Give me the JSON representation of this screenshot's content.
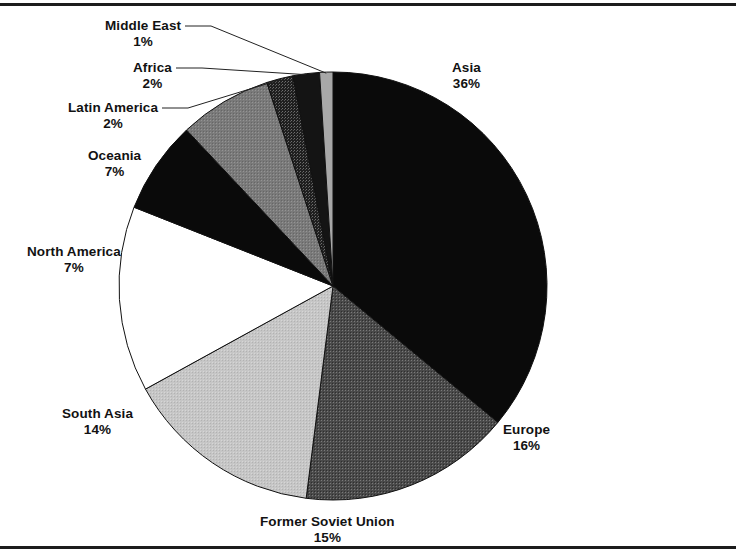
{
  "figure": {
    "name": "world-population-pie-chart",
    "background_color": "#ffffff",
    "border_color": "#1c1c1c",
    "text_color": "#121212"
  },
  "chart_data": {
    "type": "pie",
    "title": "",
    "subtitle": "",
    "xlabel": "",
    "ylabel": "",
    "legend_position": "none",
    "grid": false,
    "units": "percent",
    "start_angle_deg": 0,
    "direction": "clockwise",
    "total": 100,
    "categories": [
      "Asia",
      "Europe",
      "Former Soviet Union",
      "South Asia",
      "North America",
      "Oceania",
      "Latin America",
      "Africa",
      "Middle East"
    ],
    "values": [
      36,
      16,
      15,
      14,
      7,
      7,
      2,
      2,
      1
    ],
    "slices": [
      {
        "label": "Asia",
        "value": 36,
        "percent_text": "36%",
        "fill": "#0a0a0a",
        "pattern": "solid-black",
        "label_x": 452,
        "label_y": 60,
        "leader": false
      },
      {
        "label": "Europe",
        "value": 16,
        "percent_text": "16%",
        "fill": "#535353",
        "pattern": "halftone-dark-gray",
        "label_x": 503,
        "label_y": 422,
        "leader": false
      },
      {
        "label": "Former Soviet Union",
        "value": 15,
        "percent_text": "15%",
        "fill": "#c2c2c2",
        "pattern": "halftone-light-gray",
        "label_x": 260,
        "label_y": 514,
        "leader": false
      },
      {
        "label": "South Asia",
        "value": 14,
        "percent_text": "14%",
        "fill": "#ffffff",
        "pattern": "solid-white",
        "label_x": 62,
        "label_y": 406,
        "leader": false
      },
      {
        "label": "North America",
        "value": 7,
        "percent_text": "7%",
        "fill": "#0a0a0a",
        "pattern": "solid-black",
        "label_x": 27,
        "label_y": 244,
        "leader": false
      },
      {
        "label": "Oceania",
        "value": 7,
        "percent_text": "7%",
        "fill": "#7d7d7d",
        "pattern": "halftone-medium-gray",
        "label_x": 88,
        "label_y": 148,
        "leader": false
      },
      {
        "label": "Latin America",
        "value": 2,
        "percent_text": "2%",
        "fill": "#3a3a3a",
        "pattern": "halftone-dotted-dark",
        "label_x": 68,
        "label_y": 100,
        "leader": true
      },
      {
        "label": "Africa",
        "value": 2,
        "percent_text": "2%",
        "fill": "#141414",
        "pattern": "solid-near-black",
        "label_x": 133,
        "label_y": 60,
        "leader": true
      },
      {
        "label": "Middle East",
        "value": 1,
        "percent_text": "1%",
        "fill": "#a8a8a8",
        "pattern": "solid-gray",
        "label_x": 105,
        "label_y": 18,
        "leader": true
      }
    ]
  }
}
